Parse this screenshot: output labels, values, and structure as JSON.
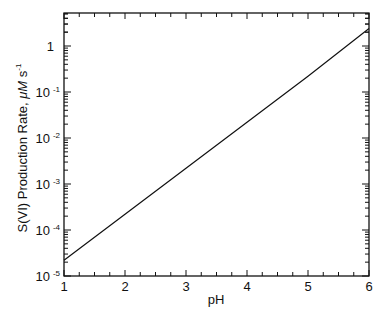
{
  "chart_data": {
    "type": "line",
    "title": "",
    "xlabel": "pH",
    "ylabel": "S(VI)  Production  Rate,  μM  s⁻¹",
    "ylabel_parts": {
      "main": "S(VI)  Production  Rate,  ",
      "unit": "μM",
      "unit2": "s",
      "unit2_exp": "-1"
    },
    "xscale": "linear",
    "yscale": "log",
    "xlim": [
      1,
      6
    ],
    "ylim": [
      1e-05,
      5.2
    ],
    "grid": false,
    "legend": null,
    "x_ticks": [
      "1",
      "2",
      "3",
      "4",
      "5",
      "6"
    ],
    "y_ticks": [
      {
        "base": "10",
        "exp": "-5",
        "value": 1e-05
      },
      {
        "base": "10",
        "exp": "-4",
        "value": 0.0001
      },
      {
        "base": "10",
        "exp": "-3",
        "value": 0.001
      },
      {
        "base": "10",
        "exp": "-2",
        "value": 0.01
      },
      {
        "base": "10",
        "exp": "-1",
        "value": 0.1
      },
      {
        "base": "1",
        "exp": "",
        "value": 1
      }
    ],
    "series": [
      {
        "name": "S(VI) production rate",
        "x": [
          1,
          2,
          3,
          4,
          5,
          6
        ],
        "values": [
          2.2e-05,
          0.00022,
          0.0022,
          0.022,
          0.22,
          2.4
        ],
        "color": "#111111"
      }
    ]
  }
}
